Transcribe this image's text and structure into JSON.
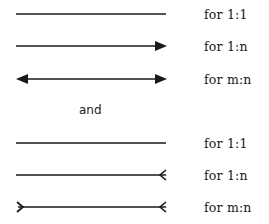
{
  "diagram": {
    "type": "relationship-cardinality-notation-legend",
    "group_1": {
      "notation": "arrowhead",
      "rows": [
        {
          "label": "for 1:1",
          "left_end": "none",
          "right_end": "none"
        },
        {
          "label": "for 1:n",
          "left_end": "none",
          "right_end": "filled-arrowhead"
        },
        {
          "label": "for m:n",
          "left_end": "filled-arrowhead",
          "right_end": "filled-arrowhead"
        }
      ]
    },
    "separator": "and",
    "group_2": {
      "notation": "crows-foot",
      "rows": [
        {
          "label": "for 1:1",
          "left_end": "none",
          "right_end": "none"
        },
        {
          "label": "for 1:n",
          "left_end": "none",
          "right_end": "crows-foot"
        },
        {
          "label": "for m:n",
          "left_end": "crows-foot",
          "right_end": "crows-foot"
        }
      ]
    },
    "colors": {
      "line": "#1a1a1a",
      "background": "#ffffff"
    }
  }
}
